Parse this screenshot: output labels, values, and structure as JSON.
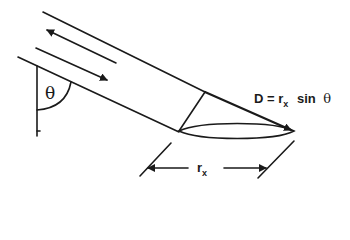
{
  "diagram": {
    "type": "geometry-schematic",
    "labels": {
      "theta_angle": "θ",
      "equation_lhs": "D = r",
      "equation_sub": "x",
      "equation_rhs": "sin",
      "equation_theta": "θ",
      "dimension_r": "r",
      "dimension_sub": "x"
    },
    "elements": {
      "tube_top_edge": "line",
      "tube_bottom_edge": "line",
      "flow_arrow_up": "arrow pointing up-left",
      "flow_arrow_down": "arrow pointing down-right",
      "vertical_reference": "line",
      "angle_arc": "arc",
      "ellipse_cross_section": "ellipse",
      "diameter_arrow": "arrow D",
      "dimension_arrows": "rx dimension"
    },
    "stroke_color": "#1a1a1a",
    "background_color": "#ffffff"
  }
}
